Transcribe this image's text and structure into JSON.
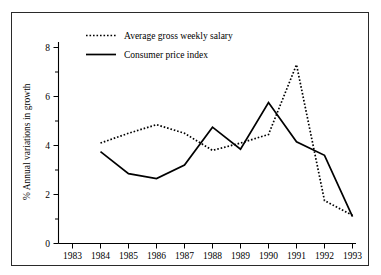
{
  "chart_data": {
    "type": "line",
    "title": "",
    "subtitle": "",
    "xlabel": "",
    "ylabel": "% Annual variations in growth",
    "x": [
      1984,
      1985,
      1986,
      1987,
      1988,
      1989,
      1990,
      1991,
      1992,
      1993
    ],
    "xtick_labels": [
      "1983",
      "1984",
      "1985",
      "1986",
      "1987",
      "1988",
      "1989",
      "1990",
      "1991",
      "1992",
      "1993"
    ],
    "ytick_labels": [
      "0",
      "2",
      "4",
      "6",
      "8"
    ],
    "ytick_values": [
      0,
      2,
      4,
      6,
      8
    ],
    "ylim": [
      0,
      8.6
    ],
    "xlim": [
      1983,
      1993.6
    ],
    "grid": false,
    "legend_position": "top-left-inside",
    "series": [
      {
        "name": "Average gross weekly salary",
        "style": "dotted",
        "color": "#000000",
        "values": [
          4.1,
          4.5,
          4.85,
          4.5,
          3.8,
          4.1,
          4.45,
          7.3,
          1.75,
          1.15
        ]
      },
      {
        "name": "Consumer price index",
        "style": "solid",
        "color": "#000000",
        "values": [
          3.75,
          2.85,
          2.65,
          3.2,
          4.75,
          3.85,
          5.75,
          4.15,
          3.6,
          1.1
        ]
      }
    ]
  },
  "legend": {
    "items": [
      {
        "label": "Average gross weekly salary",
        "style": "dotted"
      },
      {
        "label": "Consumer price index",
        "style": "solid"
      }
    ]
  },
  "axes": {
    "y_title": "% Annual variations in growth"
  }
}
